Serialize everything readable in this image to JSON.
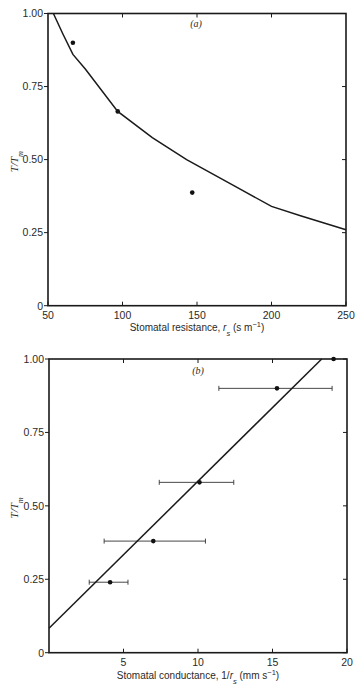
{
  "chart_data": [
    {
      "id": "a",
      "type": "scatter",
      "panel_label": "(a)",
      "title": "",
      "xlabel": "Stomatal resistance, r_s (s m^-1)",
      "xlabel_parts": [
        {
          "t": "Stomatal resistance, "
        },
        {
          "t": "r",
          "italic": true
        },
        {
          "t": "s",
          "sub": true,
          "italic": true
        },
        {
          "t": "  (s m"
        },
        {
          "t": "−1",
          "sup": true
        },
        {
          "t": ")"
        }
      ],
      "ylabel": "T/T_m",
      "ylabel_parts": [
        {
          "t": "T/T",
          "italic": true
        },
        {
          "t": "m",
          "sub": true,
          "italic": true
        }
      ],
      "xlim": [
        50,
        250
      ],
      "ylim": [
        0,
        1.0
      ],
      "grid": false,
      "legend": null,
      "xticks": [
        50,
        100,
        150,
        200,
        250
      ],
      "xtick_labels": [
        "50",
        "100",
        "150",
        "200",
        "250"
      ],
      "yticks": [
        0,
        0.25,
        0.5,
        0.75,
        1.0
      ],
      "ytick_labels": [
        "0",
        "0.25",
        "0.50",
        "0.75",
        "1.00"
      ],
      "series": [
        {
          "name": "observed",
          "kind": "points",
          "points": [
            {
              "x": 66.7,
              "y": 0.9
            },
            {
              "x": 96.8,
              "y": 0.665
            },
            {
              "x": 146.8,
              "y": 0.387
            }
          ]
        },
        {
          "name": "fitted curve",
          "kind": "curve",
          "points": [
            {
              "x": 53.6,
              "y": 1.0
            },
            {
              "x": 60,
              "y": 0.93
            },
            {
              "x": 66.7,
              "y": 0.86
            },
            {
              "x": 75,
              "y": 0.81
            },
            {
              "x": 96.8,
              "y": 0.665
            },
            {
              "x": 120,
              "y": 0.575
            },
            {
              "x": 143,
              "y": 0.5
            },
            {
              "x": 175,
              "y": 0.41
            },
            {
              "x": 200,
              "y": 0.34
            },
            {
              "x": 220,
              "y": 0.307
            },
            {
              "x": 250,
              "y": 0.26
            }
          ]
        }
      ],
      "layout": {
        "left": 48,
        "right": 346,
        "top": 13.5,
        "bottom": 305.7,
        "panel_label_pos": [
          196,
          27
        ],
        "top_ticks": [
          100,
          150,
          200
        ],
        "xlabel_y": 331,
        "ylabel_x": 18,
        "xtick_label_y": 319
      }
    },
    {
      "id": "b",
      "type": "scatter",
      "panel_label": "(b)",
      "title": "",
      "xlabel": "Stomatal conductance, 1/r_s (mm s^-1)",
      "xlabel_parts": [
        {
          "t": "Stomatal conductance, 1/"
        },
        {
          "t": "r",
          "italic": true
        },
        {
          "t": "s",
          "sub": true,
          "italic": true
        },
        {
          "t": "  (mm s"
        },
        {
          "t": "−1",
          "sup": true
        },
        {
          "t": ")"
        }
      ],
      "ylabel": "T/T_m",
      "ylabel_parts": [
        {
          "t": "T/T",
          "italic": true
        },
        {
          "t": "m",
          "sub": true,
          "italic": true
        }
      ],
      "xlim": [
        0,
        20
      ],
      "ylim": [
        0,
        1.0
      ],
      "grid": false,
      "legend": null,
      "xticks": [
        5,
        10,
        15,
        20
      ],
      "xtick_labels": [
        "5",
        "10",
        "15",
        "20"
      ],
      "yticks": [
        0,
        0.25,
        0.5,
        0.75,
        1.0
      ],
      "ytick_labels": [
        "0",
        "0.25",
        "0.50",
        "0.75",
        "1.00"
      ],
      "series": [
        {
          "name": "observed",
          "kind": "points",
          "points": [
            {
              "x": 4.1,
              "y": 0.24,
              "xmin": 2.7,
              "xmax": 5.3
            },
            {
              "x": 7.0,
              "y": 0.38,
              "xmin": 3.7,
              "xmax": 10.5
            },
            {
              "x": 10.1,
              "y": 0.58,
              "xmin": 7.4,
              "xmax": 12.4
            },
            {
              "x": 15.3,
              "y": 0.9,
              "xmin": 11.4,
              "xmax": 19.0
            },
            {
              "x": 19.1,
              "y": 1.0
            }
          ]
        },
        {
          "name": "linear fit",
          "kind": "curve",
          "points": [
            {
              "x": 0,
              "y": 0.083
            },
            {
              "x": 18.3,
              "y": 1.0
            }
          ]
        }
      ],
      "layout": {
        "left": 49,
        "right": 347,
        "top": 359,
        "bottom": 652.7,
        "panel_label_pos": [
          198,
          374
        ],
        "top_ticks": [
          5,
          10,
          15
        ],
        "xlabel_y": 679,
        "ylabel_x": 18,
        "xtick_label_y": 666
      }
    }
  ]
}
